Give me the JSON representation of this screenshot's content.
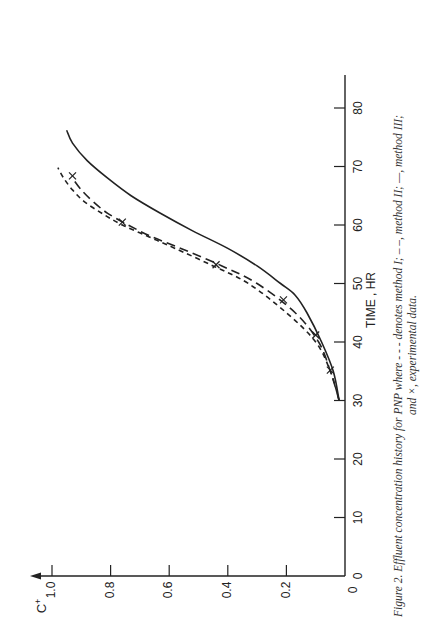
{
  "figure": {
    "caption_line1": "Figure 2.  Effluent concentration history for PNP where - - - denotes method I; – –, method II; —, method III;",
    "caption_line2": "and ×, experimental data.",
    "orientation": "rotated 90° counter-clockwise on page"
  },
  "chart_data": {
    "type": "line",
    "title": "Effluent concentration history for PNP",
    "xlabel": "TIME , HR",
    "ylabel": "C+",
    "xlim": [
      0,
      85
    ],
    "ylim": [
      0,
      1.05
    ],
    "x_ticks": [
      0,
      10,
      20,
      30,
      40,
      50,
      60,
      70,
      80
    ],
    "x_tick_labels": [
      "0",
      "10",
      "20",
      "30",
      "40",
      "50",
      "60",
      "70",
      "80"
    ],
    "y_ticks": [
      0,
      0.2,
      0.4,
      0.6,
      0.8,
      1.0
    ],
    "y_tick_labels": [
      "0",
      "0.2",
      "0.4",
      "0.6",
      "0.8",
      "1.0"
    ],
    "grid": false,
    "legend": "in caption",
    "series": [
      {
        "name": "method I",
        "style": "short-dash",
        "x": [
          30,
          35,
          40,
          45,
          50,
          53,
          56,
          58,
          60,
          62,
          64,
          66,
          68,
          69.8
        ],
        "y": [
          0.02,
          0.05,
          0.1,
          0.2,
          0.33,
          0.45,
          0.58,
          0.67,
          0.76,
          0.83,
          0.89,
          0.93,
          0.96,
          0.98
        ]
      },
      {
        "name": "method II",
        "style": "long-dash",
        "x": [
          30,
          35,
          40,
          45,
          50,
          53,
          56,
          58,
          60,
          62,
          64,
          66,
          68
        ],
        "y": [
          0.02,
          0.05,
          0.09,
          0.17,
          0.3,
          0.42,
          0.56,
          0.66,
          0.74,
          0.81,
          0.86,
          0.9,
          0.93
        ]
      },
      {
        "name": "method III",
        "style": "solid",
        "x": [
          30,
          35,
          40,
          45,
          48,
          50,
          53,
          56,
          59,
          62,
          65,
          68,
          71,
          74,
          76.2
        ],
        "y": [
          0.02,
          0.04,
          0.08,
          0.13,
          0.17,
          0.22,
          0.3,
          0.4,
          0.52,
          0.63,
          0.73,
          0.81,
          0.88,
          0.93,
          0.95
        ]
      },
      {
        "name": "experimental data",
        "style": "x-marker",
        "x": [
          35.2,
          41.2,
          47.2,
          53.2,
          60.5,
          68.4
        ],
        "y": [
          0.05,
          0.1,
          0.21,
          0.44,
          0.76,
          0.93
        ]
      }
    ]
  },
  "axes": {
    "y_label": "C",
    "y_label_sup": "+",
    "x_label": "TIME , HR"
  }
}
